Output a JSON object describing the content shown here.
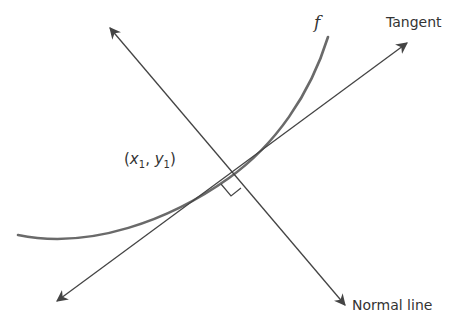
{
  "diagram": {
    "labels": {
      "function": "f",
      "tangent": "Tangent",
      "normal": "Normal line",
      "point_open": "(",
      "point_x": "x",
      "point_x_sub": "1",
      "point_sep": ", ",
      "point_y": "y",
      "point_y_sub": "1",
      "point_close": ")"
    },
    "colors": {
      "curve": "#666666",
      "lines": "#444444",
      "text": "#333333"
    },
    "geometry": {
      "point_of_tangency": [
        229,
        178
      ],
      "tangent_line": {
        "from": [
          57,
          301
        ],
        "to": [
          407,
          43
        ]
      },
      "normal_line": {
        "from": [
          110,
          28
        ],
        "to": [
          345,
          305
        ]
      },
      "curve_path": "M18,235 C90,250 170,220 229,178 C275,145 310,95 328,37"
    }
  }
}
